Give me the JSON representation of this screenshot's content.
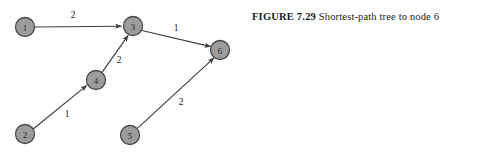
{
  "caption": {
    "label": "FIGURE 7.29",
    "text": "Shortest-path tree to node 6"
  },
  "graph": {
    "type": "directed-graph",
    "nodes": [
      {
        "id": "1",
        "label": "1",
        "cx": 25,
        "cy": 27,
        "r": 9.5
      },
      {
        "id": "2",
        "label": "2",
        "cx": 25,
        "cy": 134,
        "r": 9.5
      },
      {
        "id": "3",
        "label": "3",
        "cx": 133,
        "cy": 26,
        "r": 9.5
      },
      {
        "id": "4",
        "label": "4",
        "cx": 96,
        "cy": 80,
        "r": 9.5
      },
      {
        "id": "5",
        "label": "5",
        "cx": 130,
        "cy": 135,
        "r": 9.5
      },
      {
        "id": "6",
        "label": "6",
        "cx": 220,
        "cy": 50,
        "r": 9.5
      }
    ],
    "edges": [
      {
        "from": "1",
        "to": "3",
        "weight": "2",
        "lx": 73,
        "ly": 15
      },
      {
        "from": "4",
        "to": "3",
        "weight": "2",
        "lx": 119,
        "ly": 60
      },
      {
        "from": "2",
        "to": "4",
        "weight": "1",
        "lx": 67,
        "ly": 114
      },
      {
        "from": "3",
        "to": "6",
        "weight": "1",
        "lx": 176,
        "ly": 28
      },
      {
        "from": "5",
        "to": "6",
        "weight": "2",
        "lx": 181,
        "ly": 102
      }
    ]
  },
  "colors": {
    "node_fill": "#9c9c9c",
    "node_stroke": "#4a4a4a",
    "edge": "#3d3d3d",
    "background": "#fefefe",
    "text": "#1c1c1c"
  }
}
